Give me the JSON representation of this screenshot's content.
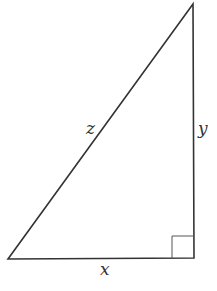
{
  "diagram": {
    "type": "right-triangle",
    "vertices": {
      "top": [
        193,
        4
      ],
      "bottom_left": [
        8,
        259
      ],
      "bottom_right": [
        194,
        258
      ]
    },
    "right_angle_box": {
      "x": 172,
      "y": 236,
      "size": 22
    },
    "labels": {
      "hypotenuse": "z",
      "vertical_leg": "y",
      "horizontal_leg": "x"
    },
    "stroke_color": "#333333"
  }
}
